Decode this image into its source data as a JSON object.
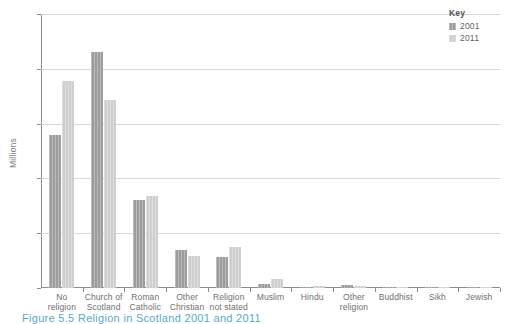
{
  "caption": "Figure 5.5 Religion in Scotland 2001 and 2011",
  "legend": {
    "title": "Key",
    "entries": [
      {
        "label": "2001",
        "color": "#9d9d9d"
      },
      {
        "label": "2011",
        "color": "#cfcfcf"
      }
    ]
  },
  "chart_data": {
    "type": "bar",
    "title": "Figure 5.5 Religion in Scotland 2001 and 2011",
    "xlabel": "",
    "ylabel": "Millions",
    "ylim": [
      0.0,
      2.5
    ],
    "yticks": [
      "0.0",
      "0.5",
      "1.0",
      "1.5",
      "2.0",
      "2.5"
    ],
    "ytick_values": [
      0.0,
      0.5,
      1.0,
      1.5,
      2.0,
      2.5
    ],
    "grid": true,
    "legend_position": "top-right",
    "categories": [
      "No religion",
      "Church of Scotland",
      "Roman Catholic",
      "Other Christian",
      "Religion not stated",
      "Muslim",
      "Hindu",
      "Other religion",
      "Buddhist",
      "Sikh",
      "Jewish"
    ],
    "category_lines": [
      [
        "No",
        "religion"
      ],
      [
        "Church of",
        "Scotland"
      ],
      [
        "Roman",
        "Catholic"
      ],
      [
        "Other",
        "Christian"
      ],
      [
        "Religion",
        "not stated"
      ],
      [
        "Muslim",
        ""
      ],
      [
        "Hindu",
        ""
      ],
      [
        "Other",
        "religion"
      ],
      [
        "Buddhist",
        ""
      ],
      [
        "Sikh",
        ""
      ],
      [
        "Jewish",
        ""
      ]
    ],
    "series": [
      {
        "name": "2001",
        "color": "#9d9d9d",
        "values": [
          1.4,
          2.15,
          0.8,
          0.35,
          0.28,
          0.04,
          0.006,
          0.027,
          0.007,
          0.006,
          0.006
        ]
      },
      {
        "name": "2011",
        "color": "#cfcfcf",
        "values": [
          1.89,
          1.72,
          0.84,
          0.29,
          0.37,
          0.08,
          0.016,
          0.015,
          0.013,
          0.009,
          0.006
        ]
      }
    ]
  }
}
